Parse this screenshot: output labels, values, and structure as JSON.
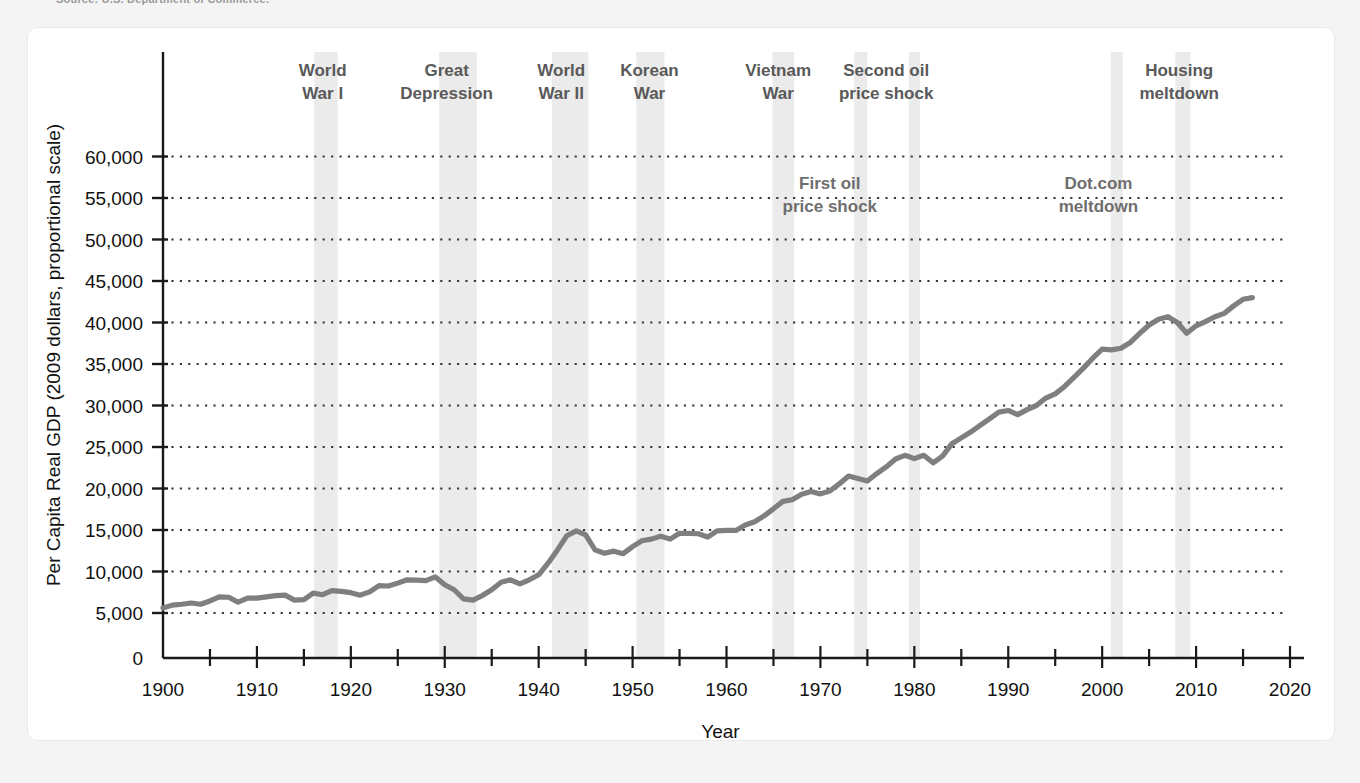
{
  "source_note": "Source: U.S. Department of Commerce.",
  "axis": {
    "y_title": "Per Capita Real GDP (2009 dollars, proportional scale)",
    "x_title": "Year",
    "y_ticks": [
      "0",
      "5,000",
      "10,000",
      "15,000",
      "20,000",
      "25,000",
      "30,000",
      "35,000",
      "40,000",
      "45,000",
      "50,000",
      "55,000",
      "60,000"
    ],
    "x_ticks": [
      "1900",
      "1910",
      "1920",
      "1930",
      "1940",
      "1950",
      "1960",
      "1970",
      "1980",
      "1990",
      "2000",
      "2010",
      "2020"
    ]
  },
  "colors": {
    "line": "#7f7f7f",
    "band": "#ebebeb",
    "grid": "#3a3a3a",
    "axis": "#1a1a1a",
    "label": "#5a5a5a",
    "card": "#ffffff",
    "page": "#f4f4f4"
  },
  "event_labels": [
    {
      "name": "world-war-i",
      "lines": [
        "World",
        "War I"
      ],
      "x": 1917.0,
      "anchor": "middle",
      "placement": "top"
    },
    {
      "name": "great-depression",
      "lines": [
        "Great",
        "Depression"
      ],
      "x": 1930.2,
      "anchor": "middle",
      "placement": "top"
    },
    {
      "name": "world-war-ii",
      "lines": [
        "World",
        "War II"
      ],
      "x": 1942.4,
      "anchor": "middle",
      "placement": "top"
    },
    {
      "name": "korean-war",
      "lines": [
        "Korean",
        "War"
      ],
      "x": 1951.8,
      "anchor": "middle",
      "placement": "top"
    },
    {
      "name": "vietnam-war",
      "lines": [
        "Vietnam",
        "War"
      ],
      "x": 1965.5,
      "anchor": "middle",
      "placement": "top"
    },
    {
      "name": "second-oil-price-shock",
      "lines": [
        "Second oil",
        "price shock"
      ],
      "x": 1977.0,
      "anchor": "middle",
      "placement": "top"
    },
    {
      "name": "housing-meltdown",
      "lines": [
        "Housing",
        "meltdown"
      ],
      "x": 2008.2,
      "anchor": "middle",
      "placement": "top"
    },
    {
      "name": "first-oil-price-shock",
      "lines": [
        "First oil",
        "price shock"
      ],
      "x": 1971.0,
      "anchor": "middle",
      "placement": "inner",
      "y": 55500
    },
    {
      "name": "dot-com-meltdown",
      "lines": [
        "Dot.com",
        "meltdown"
      ],
      "x": 1999.6,
      "anchor": "middle",
      "placement": "inner",
      "y": 55500
    }
  ],
  "shaded_bands": [
    {
      "name": "band-world-war-i",
      "start": 1916.1,
      "end": 1918.6
    },
    {
      "name": "band-great-depression",
      "start": 1929.4,
      "end": 1933.4
    },
    {
      "name": "band-world-war-ii",
      "start": 1941.4,
      "end": 1945.3
    },
    {
      "name": "band-korean-war",
      "start": 1950.4,
      "end": 1953.4
    },
    {
      "name": "band-vietnam-war",
      "start": 1964.9,
      "end": 1967.2
    },
    {
      "name": "band-first-oil-price-shock",
      "start": 1973.6,
      "end": 1975.0
    },
    {
      "name": "band-second-oil-price-shock",
      "start": 1979.4,
      "end": 1980.6
    },
    {
      "name": "band-dot-com-meltdown",
      "start": 2000.9,
      "end": 2002.2
    },
    {
      "name": "band-housing-meltdown",
      "start": 2007.8,
      "end": 2009.4
    }
  ],
  "chart_data": {
    "type": "line",
    "title": "",
    "xlabel": "Year",
    "ylabel": "Per Capita Real GDP (2009 dollars, proportional scale)",
    "xlim": [
      1900,
      2020
    ],
    "ylim": [
      0,
      62000
    ],
    "grid": true,
    "legend": "none",
    "series": [
      {
        "name": "Per Capita Real GDP",
        "color": "#7f7f7f",
        "x": [
          1900,
          1901,
          1902,
          1903,
          1904,
          1905,
          1906,
          1907,
          1908,
          1909,
          1910,
          1911,
          1912,
          1913,
          1914,
          1915,
          1916,
          1917,
          1918,
          1919,
          1920,
          1921,
          1922,
          1923,
          1924,
          1925,
          1926,
          1927,
          1928,
          1929,
          1930,
          1931,
          1932,
          1933,
          1934,
          1935,
          1936,
          1937,
          1938,
          1939,
          1940,
          1941,
          1942,
          1943,
          1944,
          1945,
          1946,
          1947,
          1948,
          1949,
          1950,
          1951,
          1952,
          1953,
          1954,
          1955,
          1956,
          1957,
          1958,
          1959,
          1960,
          1961,
          1962,
          1963,
          1964,
          1965,
          1966,
          1967,
          1968,
          1969,
          1970,
          1971,
          1972,
          1973,
          1974,
          1975,
          1976,
          1977,
          1978,
          1979,
          1980,
          1981,
          1982,
          1983,
          1984,
          1985,
          1986,
          1987,
          1988,
          1989,
          1990,
          1991,
          1992,
          1993,
          1994,
          1995,
          1996,
          1997,
          1998,
          1999,
          2000,
          2001,
          2002,
          2003,
          2004,
          2005,
          2006,
          2007,
          2008,
          2009,
          2010,
          2011,
          2012,
          2013,
          2014,
          2015,
          2016
        ],
        "values": [
          5600,
          5950,
          6050,
          6200,
          6050,
          6450,
          6950,
          6900,
          6300,
          6800,
          6800,
          6950,
          7100,
          7150,
          6550,
          6600,
          7400,
          7200,
          7700,
          7600,
          7450,
          7150,
          7550,
          8300,
          8250,
          8600,
          9000,
          8950,
          8900,
          9350,
          8400,
          7800,
          6700,
          6550,
          7100,
          7800,
          8700,
          9000,
          8500,
          9000,
          9600,
          11000,
          12600,
          14300,
          14900,
          14400,
          12600,
          12200,
          12450,
          12150,
          13000,
          13700,
          13900,
          14250,
          13900,
          14600,
          14600,
          14550,
          14150,
          14900,
          14950,
          14950,
          15600,
          16000,
          16700,
          17550,
          18450,
          18650,
          19300,
          19650,
          19350,
          19700,
          20550,
          21500,
          21200,
          20900,
          21800,
          22600,
          23550,
          24000,
          23600,
          24000,
          23100,
          23900,
          25400,
          26100,
          26800,
          27600,
          28400,
          29200,
          29400,
          28900,
          29500,
          30000,
          30900,
          31400,
          32300,
          33400,
          34500,
          35700,
          36800,
          36700,
          36900,
          37600,
          38700,
          39700,
          40400,
          40700,
          40000,
          38700,
          39600,
          40100,
          40700,
          41100,
          42000,
          42800,
          43000
        ]
      }
    ]
  }
}
